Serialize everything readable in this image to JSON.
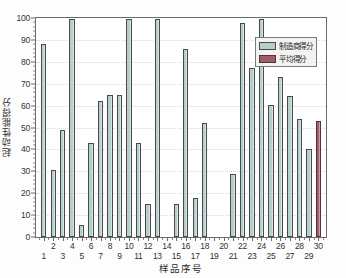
{
  "chart_data": {
    "type": "bar",
    "title": "",
    "xlabel": "样品序号",
    "ylabel": "起动性能得分",
    "ylim": [
      0,
      100
    ],
    "ytick_step": 10,
    "xlim": [
      0,
      31
    ],
    "grid": true,
    "legend_position": "top-right",
    "categories": [
      "1",
      "2",
      "3",
      "4",
      "5",
      "6",
      "7",
      "8",
      "9",
      "10",
      "11",
      "12",
      "13",
      "14",
      "15",
      "16",
      "17",
      "18",
      "19",
      "20",
      "21",
      "22",
      "23",
      "24",
      "25",
      "26",
      "27",
      "28",
      "29",
      "30"
    ],
    "values": [
      88,
      30.5,
      49,
      99.5,
      5.5,
      43,
      62,
      65,
      65,
      99.5,
      43,
      15,
      99.5,
      0,
      15,
      86,
      18,
      52,
      0,
      0,
      29,
      97.5,
      77,
      99.5,
      60.5,
      73,
      64.5,
      54,
      40,
      53
    ],
    "series": [
      {
        "name": "制造商得分",
        "color": "#b5cfcd",
        "values": [
          88,
          30.5,
          49,
          99.5,
          5.5,
          43,
          62,
          65,
          65,
          99.5,
          43,
          15,
          99.5,
          0,
          15,
          86,
          18,
          52,
          0,
          0,
          29,
          97.5,
          77,
          99.5,
          60.5,
          73,
          64.5,
          54,
          40,
          null
        ]
      },
      {
        "name": "平均得分",
        "color": "#9d5d6a",
        "values": [
          null,
          null,
          null,
          null,
          null,
          null,
          null,
          null,
          null,
          null,
          null,
          null,
          null,
          null,
          null,
          null,
          null,
          null,
          null,
          null,
          null,
          null,
          null,
          null,
          null,
          null,
          null,
          null,
          null,
          53
        ]
      }
    ],
    "ytick_labels": [
      "0",
      "10",
      "20",
      "30",
      "40",
      "50",
      "60",
      "70",
      "80",
      "90",
      "100"
    ],
    "xtick_labels_top": [
      "2",
      "4",
      "6",
      "8",
      "10",
      "12",
      "14",
      "16",
      "18",
      "20",
      "22",
      "24",
      "26",
      "28",
      "30"
    ],
    "xtick_labels_bottom": [
      "1",
      "3",
      "5",
      "7",
      "9",
      "11",
      "13",
      "15",
      "17",
      "19",
      "21",
      "23",
      "25",
      "27",
      "29"
    ],
    "xtick_labels_all": [
      "1",
      "2",
      "3",
      "4",
      "5",
      "6",
      "7",
      "8",
      "9",
      "10",
      "11",
      "12",
      "13",
      "14",
      "15",
      "16",
      "17",
      "18",
      "19",
      "20",
      "21",
      "22",
      "23",
      "24",
      "25",
      "26",
      "27",
      "28",
      "29",
      "30"
    ]
  },
  "legend": {
    "entries": [
      {
        "label": "制造商得分",
        "color": "#b5cfcd"
      },
      {
        "label": "平均得分",
        "color": "#9d5d6a"
      }
    ]
  },
  "axes": {
    "y_label": "起动性能得分",
    "x_label": "样品序号"
  },
  "colors": {
    "bar": "#b5cfcd",
    "average_bar": "#9d5d6a",
    "bar_edge": "#4a4a4a",
    "axis": "#6b6b6b",
    "grid": "#d9d9d9",
    "background": "#ffffff"
  }
}
